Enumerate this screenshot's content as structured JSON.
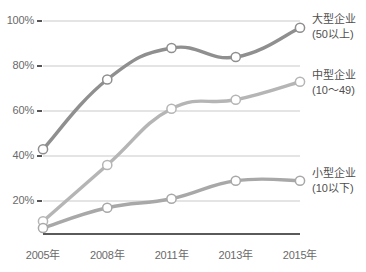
{
  "chart_data": {
    "type": "line",
    "title": "",
    "subtitle": "",
    "xlabel": "",
    "ylabel": "",
    "categories": [
      "2005年",
      "2008年",
      "2011年",
      "2013年",
      "2015年"
    ],
    "ylim": [
      0,
      100
    ],
    "ytick_labels": [
      "20%",
      "40%",
      "60%",
      "80%",
      "100%"
    ],
    "ytick_values": [
      20,
      40,
      60,
      80,
      100
    ],
    "grid": true,
    "legend_position": "right",
    "series": [
      {
        "name": "大型企业",
        "name_line2": "(50以上)",
        "color": "#8f8f8f",
        "values": [
          43,
          74,
          88,
          84,
          97
        ]
      },
      {
        "name": "中型企业",
        "name_line2": "(10～49)",
        "color": "#b5b5b5",
        "values": [
          11,
          36,
          61,
          65,
          73
        ]
      },
      {
        "name": "小型企业",
        "name_line2": "(10以下)",
        "color": "#a8a8a8",
        "values": [
          8,
          17,
          21,
          29,
          29
        ]
      }
    ]
  },
  "axis": {
    "y_ticks": [
      {
        "label": "100%"
      },
      {
        "label": "80%"
      },
      {
        "label": "60%"
      },
      {
        "label": "40%"
      },
      {
        "label": "20%"
      }
    ],
    "x_ticks": [
      {
        "label": "2005年"
      },
      {
        "label": "2008年"
      },
      {
        "label": "2011年"
      },
      {
        "label": "2013年"
      },
      {
        "label": "2015年"
      }
    ]
  },
  "legend": {
    "items": [
      {
        "line1": "大型企业",
        "line2": "(50以上)"
      },
      {
        "line1": "中型企业",
        "line2": "(10～49)"
      },
      {
        "line1": "小型企业",
        "line2": "(10以下)"
      }
    ]
  },
  "colors": {
    "large": "#8f8f8f",
    "medium": "#b5b5b5",
    "small": "#a8a8a8",
    "gridline": "#c9c9c9",
    "axis": "#5a5a5a",
    "text": "#5b5b5b"
  }
}
